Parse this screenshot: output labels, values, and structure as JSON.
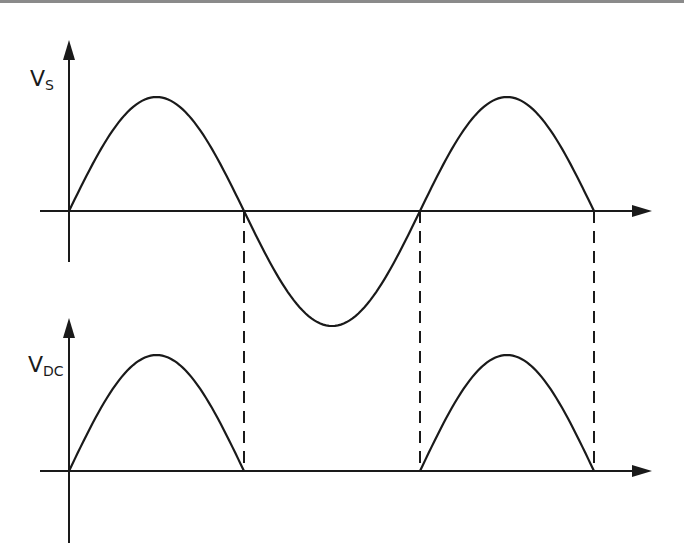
{
  "diagram": {
    "title": "",
    "colors": {
      "line": "#1a1a1a",
      "background": "#ffffff",
      "top_border": "#8a8a8a"
    },
    "top_plot": {
      "label_main": "V",
      "label_sub": "S",
      "waveform": "full sine wave",
      "origin": [
        69,
        211
      ],
      "peak_y": 97,
      "trough_y": 326,
      "zero_crossings_x": [
        69,
        244,
        420,
        594
      ],
      "x_axis": {
        "from_x": 40,
        "to_x": 652,
        "y": 211
      },
      "y_axis": {
        "x": 69,
        "top_y": 40,
        "bottom_y": 262
      }
    },
    "bottom_plot": {
      "label_main": "V",
      "label_sub": "DC",
      "waveform": "half-wave rectified sine",
      "origin": [
        69,
        471
      ],
      "peak_y": 355,
      "pulses_x": [
        [
          69,
          244
        ],
        [
          420,
          594
        ]
      ],
      "x_axis": {
        "from_x": 40,
        "to_x": 652,
        "y": 471
      },
      "y_axis": {
        "x": 69,
        "top_y": 318,
        "bottom_y": 543
      }
    },
    "dashed_guides_x": [
      244,
      420,
      594
    ],
    "dashed_guides_y": [
      211,
      471
    ]
  }
}
